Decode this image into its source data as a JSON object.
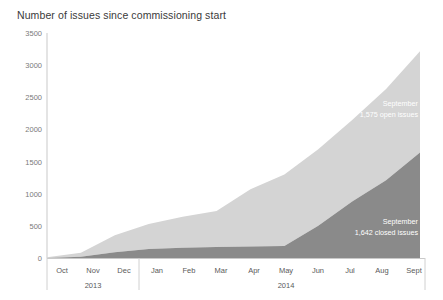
{
  "chart_data": {
    "type": "area",
    "title": "Number of issues since commissioning start",
    "xlabel": "",
    "ylabel": "",
    "ylim": [
      0,
      3500
    ],
    "yticks": [
      0,
      500,
      1000,
      1500,
      2000,
      2500,
      3000,
      3500
    ],
    "ytick_labels": [
      "0",
      "500",
      "1000",
      "1500",
      "2000",
      "2500",
      "3000",
      "3500"
    ],
    "grid": false,
    "legend_position": "inline-annotations",
    "stacked": true,
    "categories": [
      "Oct",
      "Nov",
      "Dec",
      "Jan",
      "Feb",
      "Mar",
      "Apr",
      "May",
      "Jun",
      "Jul",
      "Aug",
      "Sept"
    ],
    "x_group_labels": [
      {
        "label": "2013",
        "center_category": "Nov"
      },
      {
        "label": "2014",
        "center_category": "May"
      }
    ],
    "series": [
      {
        "name": "closed issues",
        "color": "#8a8a8a",
        "values": [
          0,
          20,
          90,
          140,
          160,
          170,
          180,
          185,
          500,
          880,
          1210,
          1642
        ]
      },
      {
        "name": "open issues",
        "color": "#d4d4d4",
        "values": [
          10,
          60,
          265,
          390,
          480,
          560,
          890,
          1115,
          1190,
          1265,
          1420,
          1575
        ]
      }
    ],
    "totals": [
      10,
      80,
      355,
      530,
      640,
      730,
      1070,
      1300,
      1690,
      2145,
      2630,
      3217
    ],
    "annotations": [
      {
        "name": "open-issues-annotation",
        "line1": "September",
        "line2": "1,575 open issues",
        "series": "open issues"
      },
      {
        "name": "closed-issues-annotation",
        "line1": "September",
        "line2": "1,642 closed issues",
        "series": "closed issues"
      }
    ],
    "axis_colors": {
      "axis_line": "#c8c8c8",
      "tick_text": "#6a6a6a",
      "title_text": "#3a3a3a",
      "annotation_text": "#ffffff"
    }
  }
}
